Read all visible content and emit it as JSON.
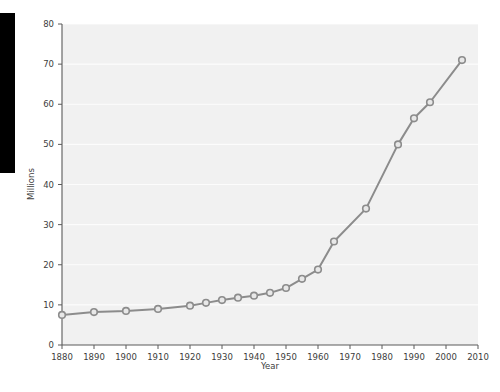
{
  "figure": {
    "background_color": "#ffffff",
    "plot_background_color": "#f1f1f1",
    "gridline_color": "#ffffff",
    "series_color": "#8c8c8c",
    "marker_fill_color": "#e8e8e8",
    "axis_color": "#5a5a5a",
    "text_color": "#3d3d3d"
  },
  "overlay": {
    "left_bar_label": "black-occlusion-bar",
    "left_bar_color": "#000000"
  },
  "chart_data": {
    "type": "line",
    "title": "",
    "subtitle": "",
    "xlabel": "Year",
    "ylabel": "Millions",
    "xlim": [
      1880,
      2010
    ],
    "ylim": [
      0,
      80
    ],
    "xticks": [
      1880,
      1890,
      1900,
      1910,
      1920,
      1930,
      1940,
      1950,
      1960,
      1970,
      1980,
      1990,
      2000,
      2010
    ],
    "xtick_labels": [
      "1880",
      "1890",
      "1900",
      "1910",
      "1920",
      "1930",
      "1940",
      "1950",
      "1960",
      "1970",
      "1980",
      "1990",
      "2000",
      "2010"
    ],
    "yticks": [
      0,
      10,
      20,
      30,
      40,
      50,
      60,
      70,
      80
    ],
    "ytick_labels": [
      "0",
      "10",
      "20",
      "30",
      "40",
      "50",
      "60",
      "70",
      "80"
    ],
    "grid": "horizontal",
    "legend": "none",
    "markers": "circle",
    "series": [
      {
        "name": "Millions",
        "x": [
          1880,
          1890,
          1900,
          1910,
          1920,
          1925,
          1930,
          1935,
          1940,
          1945,
          1950,
          1955,
          1960,
          1965,
          1975,
          1985,
          1990,
          1995,
          2005
        ],
        "values": [
          7.5,
          8.2,
          8.5,
          9.0,
          9.8,
          10.5,
          11.2,
          11.8,
          12.3,
          13.0,
          14.2,
          16.5,
          18.8,
          25.8,
          34.0,
          50.0,
          56.5,
          60.5,
          71.0
        ]
      }
    ]
  }
}
